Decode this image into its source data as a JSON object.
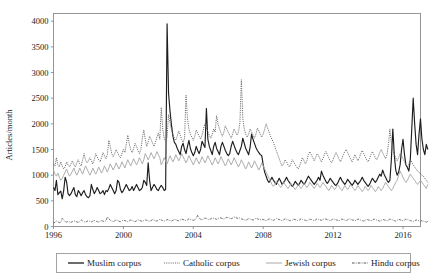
{
  "chart_data": {
    "type": "line",
    "title": "",
    "xlabel": "",
    "ylabel": "Articles/month",
    "xlim": [
      1996.0,
      2017.0
    ],
    "ylim": [
      0,
      4150
    ],
    "grid": false,
    "legend_position": "below-axes",
    "xticks": [
      "1996",
      "2000",
      "2004",
      "2008",
      "2012",
      "2016"
    ],
    "xtick_values": [
      1996,
      2000,
      2004,
      2008,
      2012,
      2016
    ],
    "yticks": [
      "0",
      "500",
      "1000",
      "1500",
      "2000",
      "2500",
      "3000",
      "3500",
      "4000"
    ],
    "ytick_values": [
      0,
      500,
      1000,
      1500,
      2000,
      2500,
      3000,
      3500,
      4000
    ],
    "x_start": 1996.0,
    "x_step": 0.08333,
    "series": [
      {
        "name": "Muslim corpus",
        "style": "solid",
        "color": "#1d1d1d",
        "width": 1.15,
        "values": [
          760,
          700,
          900,
          620,
          660,
          690,
          540,
          700,
          960,
          870,
          640,
          600,
          640,
          700,
          760,
          620,
          580,
          700,
          660,
          600,
          660,
          700,
          620,
          580,
          560,
          600,
          820,
          720,
          640,
          690,
          760,
          700,
          640,
          660,
          700,
          620,
          700,
          680,
          740,
          820,
          760,
          700,
          640,
          700,
          900,
          860,
          720,
          660,
          700,
          760,
          820,
          760,
          700,
          720,
          780,
          700,
          760,
          820,
          760,
          700,
          720,
          760,
          900,
          860,
          800,
          1240,
          900,
          700,
          760,
          820,
          780,
          720,
          700,
          760,
          800,
          760,
          700,
          720,
          3950,
          2600,
          2250,
          1980,
          1760,
          1640,
          1600,
          1520,
          1460,
          1400,
          1560,
          1620,
          1500,
          1420,
          1560,
          1680,
          1520,
          1440,
          1380,
          1440,
          1560,
          1480,
          1420,
          1500,
          1660,
          1600,
          1540,
          2300,
          1700,
          1560,
          1480,
          1400,
          1560,
          1640,
          1520,
          1460,
          1400,
          1560,
          1640,
          1560,
          1480,
          1420,
          1380,
          1420,
          1560,
          1660,
          1580,
          1500,
          1440,
          1400,
          1480,
          1560,
          1720,
          1620,
          1520,
          1460,
          1400,
          1540,
          1800,
          1700,
          1620,
          1540,
          1480,
          1440,
          1400,
          1380,
          1200,
          1060,
          980,
          900,
          860,
          900,
          960,
          900,
          860,
          820,
          880,
          940,
          880,
          820,
          860,
          900,
          960,
          900,
          860,
          820,
          780,
          820,
          880,
          840,
          800,
          840,
          900,
          860,
          820,
          860,
          920,
          980,
          940,
          900,
          860,
          820,
          860,
          900,
          960,
          900,
          1080,
          1000,
          940,
          880,
          840,
          880,
          940,
          900,
          860,
          820,
          800,
          840,
          900,
          960,
          900,
          860,
          820,
          860,
          920,
          880,
          840,
          800,
          840,
          900,
          860,
          820,
          860,
          900,
          960,
          900,
          860,
          820,
          780,
          820,
          880,
          940,
          900,
          860,
          900,
          960,
          1020,
          980,
          1100,
          1020,
          960,
          900,
          860,
          900,
          1300,
          1900,
          1400,
          1100,
          1000,
          1060,
          1200,
          1500,
          1700,
          1400,
          1200,
          1150,
          1080,
          1300,
          1900,
          2500,
          2000,
          1600,
          1400,
          1800,
          2100,
          1700,
          1500,
          1400,
          1600,
          1500
        ]
      },
      {
        "name": "Catholic corpus",
        "style": "dotted",
        "color": "#6b6b6b",
        "width": 1.0,
        "values": [
          1220,
          1180,
          1340,
          1200,
          1160,
          1260,
          1180,
          1120,
          1160,
          1260,
          1200,
          1160,
          1220,
          1280,
          1200,
          1160,
          1240,
          1300,
          1220,
          1180,
          1300,
          1420,
          1300,
          1240,
          1280,
          1340,
          1280,
          1220,
          1300,
          1420,
          1360,
          1300,
          1260,
          1340,
          1440,
          1380,
          1320,
          1400,
          1680,
          1560,
          1420,
          1360,
          1420,
          1500,
          1440,
          1380,
          1340,
          1420,
          1500,
          1440,
          1600,
          1780,
          1620,
          1500,
          1440,
          1520,
          1620,
          1560,
          1480,
          1420,
          1500,
          1720,
          1880,
          1700,
          1560,
          1640,
          1760,
          1700,
          1620,
          1560,
          1640,
          1740,
          1820,
          1700,
          2320,
          1900,
          1720,
          1660,
          1740,
          2180,
          2020,
          1880,
          1800,
          1720,
          1680,
          1760,
          1860,
          1780,
          1700,
          1640,
          1720,
          2560,
          2100,
          1900,
          1800,
          1740,
          1680,
          1760,
          1880,
          1820,
          1760,
          1700,
          1780,
          1900,
          2000,
          1920,
          1840,
          1780,
          1720,
          1800,
          1900,
          1840,
          2160,
          2000,
          1900,
          1820,
          1760,
          1840,
          1960,
          1900,
          1840,
          1780,
          1720,
          1800,
          1900,
          1840,
          1780,
          1840,
          2020,
          2860,
          2100,
          1900,
          1800,
          1740,
          1800,
          1900,
          1840,
          1780,
          1720,
          1800,
          1920,
          1860,
          1800,
          1740,
          1800,
          1900,
          2000,
          1920,
          1840,
          1760,
          1700,
          1640,
          1560,
          1480,
          1400,
          1320,
          1240,
          1180,
          1220,
          1300,
          1260,
          1200,
          1160,
          1220,
          1300,
          1260,
          1200,
          1160,
          1120,
          1180,
          1260,
          1340,
          1280,
          1220,
          1280,
          1400,
          1460,
          1400,
          1340,
          1280,
          1340,
          1420,
          1380,
          1320,
          1260,
          1320,
          1400,
          1460,
          1400,
          1340,
          1280,
          1240,
          1300,
          1380,
          1440,
          1380,
          1320,
          1260,
          1320,
          1400,
          1460,
          1500,
          1440,
          1380,
          1320,
          1260,
          1320,
          1400,
          1340,
          1280,
          1340,
          1420,
          1480,
          1420,
          1360,
          1300,
          1260,
          1320,
          1400,
          1460,
          1400,
          1340,
          1300,
          1360,
          1440,
          1500,
          1440,
          1380,
          1320,
          1400,
          1600,
          1900,
          1620,
          1480,
          1400,
          1340,
          1280,
          1340,
          1420,
          1380,
          1320,
          1260,
          1200,
          1160,
          1220,
          1300,
          1260,
          1200,
          1160,
          1120,
          1080,
          1060,
          1020,
          1000,
          980,
          940,
          900,
          860
        ]
      },
      {
        "name": "Jewish corpus",
        "style": "solid-light",
        "color": "#a8a8a8",
        "width": 0.95,
        "values": [
          1100,
          1020,
          980,
          1040,
          960,
          900,
          940,
          1000,
          1060,
          1120,
          1040,
          980,
          1020,
          1080,
          1140,
          1060,
          1000,
          1060,
          1140,
          1080,
          1020,
          1100,
          1180,
          1120,
          1060,
          1000,
          1060,
          1140,
          1080,
          1020,
          1080,
          1160,
          1100,
          1040,
          1100,
          1180,
          1120,
          1060,
          1140,
          1220,
          1160,
          1100,
          1160,
          1240,
          1180,
          1120,
          1180,
          1260,
          1200,
          1140,
          1220,
          1300,
          1240,
          1180,
          1240,
          1320,
          1260,
          1200,
          1260,
          1340,
          1280,
          1220,
          1300,
          1420,
          1360,
          1300,
          1360,
          1440,
          1380,
          1320,
          1380,
          1460,
          1400,
          1340,
          1200,
          1260,
          1340,
          1280,
          1220,
          1300,
          1380,
          1320,
          1260,
          1320,
          1400,
          1340,
          1280,
          1340,
          1420,
          1360,
          1300,
          1240,
          1300,
          1380,
          1320,
          1260,
          1200,
          1260,
          1340,
          1280,
          1220,
          1280,
          1360,
          1300,
          1240,
          1300,
          1380,
          1320,
          1260,
          1200,
          1260,
          1340,
          1280,
          1220,
          1280,
          1360,
          1300,
          1240,
          1180,
          1240,
          1320,
          1260,
          1200,
          1260,
          1340,
          1280,
          1220,
          1160,
          1220,
          1300,
          1240,
          1180,
          1120,
          1180,
          1260,
          1200,
          1140,
          1200,
          1280,
          1220,
          1160,
          1100,
          1160,
          1240,
          1180,
          1120,
          1060,
          1000,
          940,
          880,
          820,
          780,
          820,
          880,
          840,
          800,
          760,
          800,
          860,
          820,
          780,
          740,
          780,
          840,
          800,
          760,
          720,
          760,
          820,
          780,
          740,
          780,
          840,
          800,
          760,
          800,
          860,
          820,
          780,
          740,
          780,
          840,
          800,
          760,
          800,
          860,
          820,
          780,
          740,
          700,
          740,
          800,
          760,
          720,
          760,
          820,
          780,
          740,
          700,
          740,
          800,
          760,
          720,
          760,
          820,
          780,
          740,
          700,
          740,
          800,
          760,
          720,
          680,
          720,
          780,
          740,
          700,
          740,
          800,
          760,
          720,
          680,
          720,
          780,
          740,
          700,
          740,
          800,
          860,
          820,
          780,
          740,
          700,
          740,
          800,
          860,
          900,
          1000,
          1080,
          1020,
          960,
          900,
          860,
          900,
          960,
          1020,
          980,
          940,
          900,
          860,
          820,
          860,
          900,
          860,
          820,
          780,
          740,
          820
        ]
      },
      {
        "name": "Hindu corpus",
        "style": "dashdot",
        "color": "#555555",
        "width": 0.85,
        "values": [
          70,
          80,
          110,
          90,
          75,
          85,
          160,
          120,
          95,
          85,
          100,
          90,
          80,
          95,
          110,
          100,
          90,
          80,
          95,
          130,
          110,
          95,
          85,
          100,
          115,
          100,
          90,
          105,
          120,
          110,
          95,
          85,
          100,
          115,
          105,
          95,
          110,
          190,
          150,
          120,
          105,
          95,
          110,
          130,
          115,
          100,
          95,
          110,
          125,
          115,
          105,
          95,
          110,
          125,
          115,
          105,
          95,
          110,
          130,
          120,
          110,
          100,
          115,
          130,
          120,
          110,
          100,
          115,
          135,
          125,
          115,
          105,
          120,
          140,
          125,
          115,
          105,
          120,
          135,
          125,
          115,
          105,
          120,
          140,
          130,
          120,
          110,
          125,
          145,
          135,
          125,
          115,
          130,
          150,
          140,
          130,
          120,
          135,
          155,
          220,
          170,
          140,
          130,
          145,
          165,
          155,
          145,
          135,
          150,
          170,
          160,
          150,
          140,
          155,
          175,
          165,
          155,
          145,
          160,
          180,
          170,
          160,
          150,
          165,
          185,
          175,
          165,
          155,
          170,
          150,
          140,
          130,
          120,
          135,
          155,
          145,
          135,
          125,
          140,
          160,
          150,
          140,
          130,
          145,
          135,
          125,
          115,
          130,
          150,
          140,
          130,
          120,
          135,
          155,
          145,
          135,
          125,
          115,
          130,
          150,
          140,
          130,
          120,
          110,
          125,
          145,
          135,
          125,
          115,
          130,
          150,
          140,
          130,
          120,
          110,
          125,
          145,
          135,
          125,
          115,
          130,
          150,
          140,
          130,
          120,
          135,
          155,
          145,
          135,
          125,
          115,
          130,
          150,
          140,
          130,
          120,
          110,
          125,
          145,
          135,
          125,
          115,
          130,
          150,
          140,
          130,
          120,
          110,
          125,
          145,
          135,
          125,
          115,
          105,
          120,
          140,
          130,
          120,
          110,
          125,
          145,
          135,
          125,
          115,
          105,
          120,
          140,
          130,
          120,
          110,
          125,
          145,
          135,
          125,
          115,
          105,
          120,
          140,
          130,
          120,
          110,
          125,
          145,
          135,
          125,
          115,
          105,
          95,
          110,
          130,
          120,
          110,
          100,
          115,
          105,
          95,
          85,
          100
        ]
      }
    ]
  },
  "legend": {
    "entries": [
      {
        "label": "Muslim corpus",
        "style": "solid",
        "color": "#1d1d1d"
      },
      {
        "label": "Catholic corpus",
        "style": "dotted",
        "color": "#6b6b6b"
      },
      {
        "label": "Jewish corpus",
        "style": "solid-light",
        "color": "#a8a8a8"
      },
      {
        "label": "Hindu corpus",
        "style": "dashdot",
        "color": "#555555"
      }
    ]
  }
}
